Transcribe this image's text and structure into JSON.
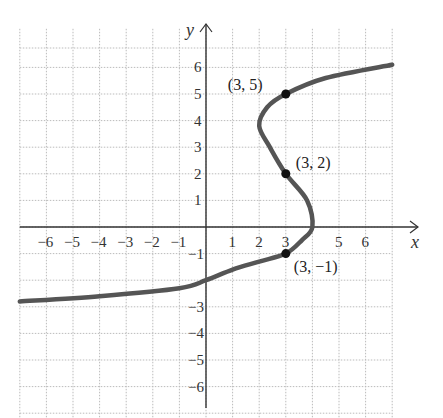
{
  "chart_data": {
    "type": "line",
    "title": "",
    "xlabel": "x",
    "ylabel": "y",
    "xlim": [
      -7,
      7
    ],
    "ylim": [
      -7,
      7
    ],
    "grid": true,
    "x_ticks": [
      "-6",
      "-5",
      "-4",
      "-3",
      "-2",
      "-1",
      "1",
      "2",
      "3",
      "5",
      "6"
    ],
    "y_ticks": [
      "6",
      "5",
      "4",
      "3",
      "2",
      "1",
      "-1",
      "-3",
      "-4",
      "-5",
      "-6"
    ],
    "curve": {
      "description": "Sideways cubic-like curve x = f(y)",
      "points": [
        [
          -7,
          -2.8
        ],
        [
          -4,
          -2.6
        ],
        [
          -1,
          -2.3
        ],
        [
          0,
          -2
        ],
        [
          1,
          -1.6
        ],
        [
          2,
          -1.3
        ],
        [
          3,
          -1
        ],
        [
          3.6,
          -0.5
        ],
        [
          4,
          0
        ],
        [
          3.8,
          1
        ],
        [
          3,
          2
        ],
        [
          2.4,
          3
        ],
        [
          2,
          3.8
        ],
        [
          2.3,
          4.5
        ],
        [
          3,
          5
        ],
        [
          4.5,
          5.6
        ],
        [
          7,
          6.1
        ]
      ]
    },
    "marked_points": [
      {
        "x": 3,
        "y": 5,
        "label": "(3, 5)"
      },
      {
        "x": 3,
        "y": 2,
        "label": "(3, 2)"
      },
      {
        "x": 3,
        "y": -1,
        "label": "(3, −1)"
      }
    ],
    "colors": {
      "curve": "#555555",
      "grid": "#bbbbbb",
      "axis": "#333333",
      "point": "#111111"
    }
  }
}
